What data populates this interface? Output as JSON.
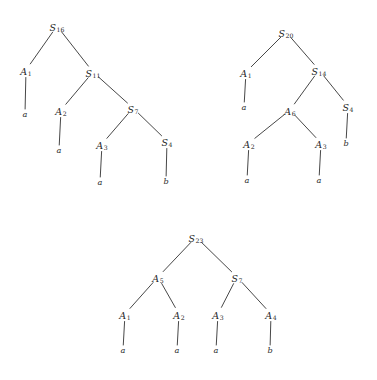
{
  "figure": {
    "kind": "parse-tree-diagram",
    "ink_color": "#262626",
    "background_color": "#ffffff",
    "tree_count": 3
  },
  "trees": [
    {
      "id": "tree-1",
      "root": "S16",
      "nodes": [
        {
          "key": "S16",
          "base": "S",
          "sub": "16",
          "x": 57,
          "y": 26
        },
        {
          "key": "A1",
          "base": "A",
          "sub": "1",
          "x": 26,
          "y": 70
        },
        {
          "key": "S11",
          "base": "S",
          "sub": "11",
          "x": 93,
          "y": 72
        },
        {
          "key": "A2",
          "base": "A",
          "sub": "2",
          "x": 61,
          "y": 110
        },
        {
          "key": "S7",
          "base": "S",
          "sub": "7",
          "x": 133,
          "y": 108
        },
        {
          "key": "A3",
          "base": "A",
          "sub": "3",
          "x": 102,
          "y": 144
        },
        {
          "key": "S4",
          "base": "S",
          "sub": "4",
          "x": 167,
          "y": 141
        }
      ],
      "leaves": [
        {
          "key": "L1",
          "text": "a",
          "x": 25,
          "y": 114
        },
        {
          "key": "L2",
          "text": "a",
          "x": 59,
          "y": 150
        },
        {
          "key": "L3",
          "text": "a",
          "x": 100,
          "y": 182
        },
        {
          "key": "L4",
          "text": "b",
          "x": 166,
          "y": 181
        }
      ],
      "edges": [
        {
          "from": "S16",
          "to": "A1"
        },
        {
          "from": "S16",
          "to": "S11"
        },
        {
          "from": "S11",
          "to": "A2"
        },
        {
          "from": "S11",
          "to": "S7"
        },
        {
          "from": "S7",
          "to": "A3"
        },
        {
          "from": "S7",
          "to": "S4"
        },
        {
          "from": "A1",
          "to": "L1"
        },
        {
          "from": "A2",
          "to": "L2"
        },
        {
          "from": "A3",
          "to": "L3"
        },
        {
          "from": "S4",
          "to": "L4"
        }
      ]
    },
    {
      "id": "tree-2",
      "root": "S20",
      "nodes": [
        {
          "key": "S20",
          "base": "S",
          "sub": "20",
          "x": 286,
          "y": 32
        },
        {
          "key": "A1",
          "base": "A",
          "sub": "1",
          "x": 246,
          "y": 72
        },
        {
          "key": "S14",
          "base": "S",
          "sub": "14",
          "x": 319,
          "y": 70
        },
        {
          "key": "A6",
          "base": "A",
          "sub": "6",
          "x": 290,
          "y": 110
        },
        {
          "key": "S4",
          "base": "S",
          "sub": "4",
          "x": 348,
          "y": 106
        },
        {
          "key": "A2",
          "base": "A",
          "sub": "2",
          "x": 249,
          "y": 143
        },
        {
          "key": "A3",
          "base": "A",
          "sub": "3",
          "x": 321,
          "y": 143
        }
      ],
      "leaves": [
        {
          "key": "L1",
          "text": "a",
          "x": 244,
          "y": 107
        },
        {
          "key": "L2",
          "text": "b",
          "x": 346,
          "y": 143
        },
        {
          "key": "L3",
          "text": "a",
          "x": 247,
          "y": 180
        },
        {
          "key": "L4",
          "text": "a",
          "x": 319,
          "y": 180
        }
      ],
      "edges": [
        {
          "from": "S20",
          "to": "A1"
        },
        {
          "from": "S20",
          "to": "S14"
        },
        {
          "from": "S14",
          "to": "A6"
        },
        {
          "from": "S14",
          "to": "S4"
        },
        {
          "from": "A6",
          "to": "A2"
        },
        {
          "from": "A6",
          "to": "A3"
        },
        {
          "from": "A1",
          "to": "L1"
        },
        {
          "from": "S4",
          "to": "L2"
        },
        {
          "from": "A2",
          "to": "L3"
        },
        {
          "from": "A3",
          "to": "L4"
        }
      ]
    },
    {
      "id": "tree-3",
      "root": "S23",
      "nodes": [
        {
          "key": "S23",
          "base": "S",
          "sub": "23",
          "x": 196,
          "y": 237
        },
        {
          "key": "A5",
          "base": "A",
          "sub": "5",
          "x": 158,
          "y": 277
        },
        {
          "key": "S7",
          "base": "S",
          "sub": "7",
          "x": 237,
          "y": 277
        },
        {
          "key": "A1",
          "base": "A",
          "sub": "1",
          "x": 125,
          "y": 314
        },
        {
          "key": "A2",
          "base": "A",
          "sub": "2",
          "x": 179,
          "y": 314
        },
        {
          "key": "A3",
          "base": "A",
          "sub": "3",
          "x": 218,
          "y": 314
        },
        {
          "key": "A4",
          "base": "A",
          "sub": "4",
          "x": 271,
          "y": 314
        }
      ],
      "leaves": [
        {
          "key": "L1",
          "text": "a",
          "x": 123,
          "y": 350
        },
        {
          "key": "L2",
          "text": "a",
          "x": 177,
          "y": 350
        },
        {
          "key": "L3",
          "text": "a",
          "x": 216,
          "y": 350
        },
        {
          "key": "L4",
          "text": "b",
          "x": 270,
          "y": 350
        }
      ],
      "edges": [
        {
          "from": "S23",
          "to": "A5"
        },
        {
          "from": "S23",
          "to": "S7"
        },
        {
          "from": "A5",
          "to": "A1"
        },
        {
          "from": "A5",
          "to": "A2"
        },
        {
          "from": "S7",
          "to": "A3"
        },
        {
          "from": "S7",
          "to": "A4"
        },
        {
          "from": "A1",
          "to": "L1"
        },
        {
          "from": "A2",
          "to": "L2"
        },
        {
          "from": "A3",
          "to": "L3"
        },
        {
          "from": "A4",
          "to": "L4"
        }
      ]
    }
  ]
}
